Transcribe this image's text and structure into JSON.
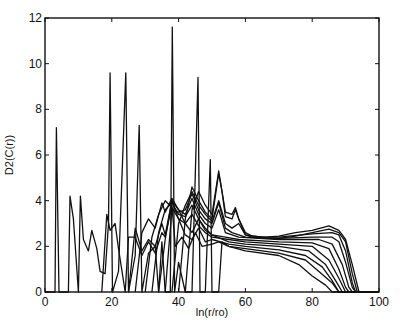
{
  "chart_data": {
    "type": "line",
    "title": "",
    "xlabel": "ln(r/ro)",
    "ylabel": "D2(C(r))",
    "xlim": [
      0,
      100
    ],
    "ylim": [
      0,
      12
    ],
    "xticks": [
      0,
      20,
      40,
      60,
      80,
      100
    ],
    "yticks": [
      0,
      2,
      4,
      6,
      8,
      10,
      12
    ],
    "xtick_labels": [
      "0",
      "20",
      "40",
      "60",
      "80",
      "100"
    ],
    "ytick_labels": [
      "0",
      "2",
      "4",
      "6",
      "8",
      "10",
      "12"
    ],
    "grid": false,
    "legend": null,
    "line_color": "#111111",
    "series": [
      {
        "name": "curve-1",
        "points": [
          [
            0,
            0
          ],
          [
            3,
            0
          ],
          [
            3.4,
            7.2
          ],
          [
            4.2,
            0
          ],
          [
            7,
            0
          ],
          [
            7.5,
            4.2
          ],
          [
            8.5,
            3.2
          ],
          [
            10,
            0
          ],
          [
            10.6,
            4.2
          ],
          [
            11.5,
            2.3
          ],
          [
            13,
            1.8
          ],
          [
            14,
            2.7
          ],
          [
            15.5,
            1.9
          ],
          [
            16.5,
            0.9
          ],
          [
            18,
            0.8
          ],
          [
            19,
            3.0
          ],
          [
            19.5,
            9.6
          ],
          [
            20.2,
            0
          ],
          [
            22,
            0.9
          ],
          [
            24.2,
            9.6
          ],
          [
            25,
            0
          ],
          [
            27,
            1.6
          ],
          [
            28.2,
            7.3
          ],
          [
            29,
            0
          ],
          [
            31,
            1.7
          ],
          [
            33,
            2.0
          ],
          [
            34,
            0
          ],
          [
            35,
            2.2
          ],
          [
            36,
            0
          ],
          [
            37.5,
            0
          ],
          [
            38.1,
            11.6
          ],
          [
            38.8,
            0
          ],
          [
            40,
            1.3
          ],
          [
            42,
            0
          ],
          [
            44,
            0
          ],
          [
            45.8,
            9.4
          ],
          [
            46.4,
            0
          ],
          [
            48,
            0
          ],
          [
            49.5,
            5.8
          ],
          [
            50,
            0
          ],
          [
            52,
            0
          ],
          [
            53,
            2.2
          ],
          [
            55,
            2.0
          ],
          [
            60,
            1.8
          ],
          [
            70,
            1.6
          ],
          [
            76,
            1.2
          ],
          [
            80,
            0.7
          ],
          [
            84,
            0.3
          ],
          [
            86,
            0
          ],
          [
            100,
            0
          ]
        ]
      },
      {
        "name": "curve-2",
        "points": [
          [
            17,
            0
          ],
          [
            18.5,
            3.4
          ],
          [
            19.5,
            2.7
          ],
          [
            21,
            3.0
          ],
          [
            22,
            1.9
          ],
          [
            24,
            0
          ],
          [
            25,
            2.4
          ],
          [
            27,
            2.4
          ],
          [
            29,
            1.6
          ],
          [
            31,
            2.2
          ],
          [
            33,
            1.7
          ],
          [
            35,
            2.6
          ],
          [
            36,
            2.4
          ],
          [
            38,
            3.8
          ],
          [
            39,
            2.0
          ],
          [
            41,
            2.4
          ],
          [
            43,
            1.9
          ],
          [
            45,
            2.6
          ],
          [
            47,
            2.0
          ],
          [
            50,
            2.1
          ],
          [
            52,
            2.2
          ],
          [
            55,
            2.0
          ],
          [
            60,
            1.9
          ],
          [
            70,
            1.7
          ],
          [
            78,
            1.4
          ],
          [
            82,
            0.9
          ],
          [
            86,
            0.4
          ],
          [
            88,
            0
          ],
          [
            100,
            0
          ]
        ]
      },
      {
        "name": "curve-3",
        "points": [
          [
            25,
            0
          ],
          [
            27,
            2.8
          ],
          [
            29,
            1.8
          ],
          [
            31,
            2.3
          ],
          [
            33,
            2.0
          ],
          [
            35,
            3.0
          ],
          [
            36,
            2.5
          ],
          [
            38,
            4.0
          ],
          [
            40,
            3.2
          ],
          [
            42,
            2.5
          ],
          [
            44,
            2.3
          ],
          [
            46,
            2.8
          ],
          [
            48,
            2.2
          ],
          [
            50,
            2.3
          ],
          [
            55,
            2.1
          ],
          [
            60,
            2.0
          ],
          [
            70,
            1.85
          ],
          [
            78,
            1.6
          ],
          [
            83,
            1.1
          ],
          [
            86,
            0.5
          ],
          [
            88,
            0
          ],
          [
            100,
            0
          ]
        ]
      },
      {
        "name": "curve-4",
        "points": [
          [
            27,
            0
          ],
          [
            29,
            2.6
          ],
          [
            31,
            3.2
          ],
          [
            33,
            2.8
          ],
          [
            35,
            3.9
          ],
          [
            36,
            3.5
          ],
          [
            38,
            4.1
          ],
          [
            40,
            3.6
          ],
          [
            42,
            3.0
          ],
          [
            44,
            2.6
          ],
          [
            46,
            3.2
          ],
          [
            48,
            2.7
          ],
          [
            50,
            2.5
          ],
          [
            55,
            2.2
          ],
          [
            60,
            2.1
          ],
          [
            70,
            2.0
          ],
          [
            79,
            1.8
          ],
          [
            84,
            1.2
          ],
          [
            87,
            0.5
          ],
          [
            89,
            0
          ],
          [
            100,
            0
          ]
        ]
      },
      {
        "name": "curve-5",
        "points": [
          [
            30,
            0
          ],
          [
            32,
            2.4
          ],
          [
            34,
            3.4
          ],
          [
            36,
            4.0
          ],
          [
            38,
            3.7
          ],
          [
            40,
            3.2
          ],
          [
            42,
            3.0
          ],
          [
            44,
            3.4
          ],
          [
            46,
            2.9
          ],
          [
            48,
            2.6
          ],
          [
            50,
            2.4
          ],
          [
            55,
            2.3
          ],
          [
            60,
            2.2
          ],
          [
            70,
            2.1
          ],
          [
            80,
            2.0
          ],
          [
            85,
            1.4
          ],
          [
            88,
            0.6
          ],
          [
            90,
            0
          ],
          [
            100,
            0
          ]
        ]
      },
      {
        "name": "curve-6",
        "points": [
          [
            32,
            0
          ],
          [
            34,
            2.6
          ],
          [
            36,
            3.6
          ],
          [
            38,
            3.9
          ],
          [
            40,
            3.4
          ],
          [
            42,
            3.3
          ],
          [
            44,
            3.8
          ],
          [
            46,
            3.2
          ],
          [
            48,
            2.8
          ],
          [
            50,
            2.5
          ],
          [
            54,
            2.4
          ],
          [
            58,
            2.3
          ],
          [
            70,
            2.2
          ],
          [
            80,
            2.15
          ],
          [
            85,
            1.9
          ],
          [
            88,
            1.0
          ],
          [
            90,
            0.2
          ],
          [
            91,
            0
          ],
          [
            100,
            0
          ]
        ]
      },
      {
        "name": "curve-7",
        "points": [
          [
            34,
            0
          ],
          [
            36,
            2.3
          ],
          [
            38,
            4.0
          ],
          [
            40,
            3.6
          ],
          [
            42,
            3.4
          ],
          [
            44,
            4.1
          ],
          [
            46,
            3.4
          ],
          [
            48,
            3.0
          ],
          [
            50,
            2.8
          ],
          [
            52,
            3.6
          ],
          [
            54,
            2.6
          ],
          [
            58,
            2.4
          ],
          [
            70,
            2.3
          ],
          [
            82,
            2.3
          ],
          [
            86,
            2.1
          ],
          [
            89,
            1.2
          ],
          [
            91,
            0.2
          ],
          [
            92,
            0
          ],
          [
            100,
            0
          ]
        ]
      },
      {
        "name": "curve-8",
        "points": [
          [
            36,
            0
          ],
          [
            38,
            3.6
          ],
          [
            40,
            3.5
          ],
          [
            42,
            3.6
          ],
          [
            44,
            4.3
          ],
          [
            46,
            3.6
          ],
          [
            48,
            3.2
          ],
          [
            50,
            3.0
          ],
          [
            52,
            3.9
          ],
          [
            54,
            2.8
          ],
          [
            56,
            2.6
          ],
          [
            58,
            2.5
          ],
          [
            60,
            2.4
          ],
          [
            70,
            2.35
          ],
          [
            80,
            2.4
          ],
          [
            86,
            2.4
          ],
          [
            88,
            2.2
          ],
          [
            90,
            1.3
          ],
          [
            92,
            0.2
          ],
          [
            93,
            0
          ],
          [
            100,
            0
          ]
        ]
      },
      {
        "name": "curve-9",
        "points": [
          [
            38,
            0
          ],
          [
            40,
            3.0
          ],
          [
            42,
            3.8
          ],
          [
            44,
            4.4
          ],
          [
            46,
            3.8
          ],
          [
            48,
            3.4
          ],
          [
            50,
            3.1
          ],
          [
            52,
            4.0
          ],
          [
            54,
            3.0
          ],
          [
            56,
            2.8
          ],
          [
            58,
            3.0
          ],
          [
            60,
            2.5
          ],
          [
            65,
            2.4
          ],
          [
            70,
            2.4
          ],
          [
            80,
            2.55
          ],
          [
            86,
            2.6
          ],
          [
            88,
            2.5
          ],
          [
            90,
            1.8
          ],
          [
            92,
            0.4
          ],
          [
            93,
            0
          ],
          [
            100,
            0
          ]
        ]
      },
      {
        "name": "curve-10",
        "points": [
          [
            40,
            0
          ],
          [
            42,
            3.2
          ],
          [
            44,
            4.6
          ],
          [
            46,
            4.0
          ],
          [
            48,
            3.5
          ],
          [
            50,
            3.2
          ],
          [
            52,
            5.2
          ],
          [
            53,
            4.4
          ],
          [
            54,
            3.3
          ],
          [
            56,
            3.2
          ],
          [
            57,
            3.6
          ],
          [
            58,
            3.2
          ],
          [
            60,
            2.5
          ],
          [
            62,
            2.4
          ],
          [
            65,
            2.35
          ],
          [
            70,
            2.35
          ],
          [
            75,
            2.45
          ],
          [
            80,
            2.6
          ],
          [
            85,
            2.75
          ],
          [
            88,
            2.6
          ],
          [
            90,
            2.2
          ],
          [
            92,
            0.8
          ],
          [
            93.5,
            0
          ],
          [
            100,
            0
          ]
        ]
      },
      {
        "name": "curve-11",
        "points": [
          [
            42,
            0
          ],
          [
            44,
            3.6
          ],
          [
            46,
            4.4
          ],
          [
            48,
            3.8
          ],
          [
            50,
            3.4
          ],
          [
            52,
            5.3
          ],
          [
            54,
            3.5
          ],
          [
            56,
            3.4
          ],
          [
            57,
            3.7
          ],
          [
            58,
            3.2
          ],
          [
            60,
            2.6
          ],
          [
            62,
            2.45
          ],
          [
            66,
            2.4
          ],
          [
            70,
            2.45
          ],
          [
            75,
            2.6
          ],
          [
            80,
            2.7
          ],
          [
            85,
            2.9
          ],
          [
            88,
            2.7
          ],
          [
            90,
            2.3
          ],
          [
            92,
            1.2
          ],
          [
            94,
            0
          ],
          [
            100,
            0
          ]
        ]
      }
    ]
  }
}
